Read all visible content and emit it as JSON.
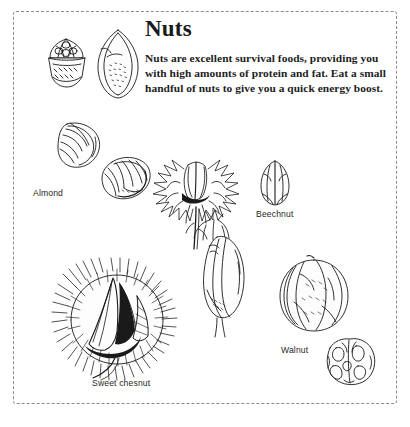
{
  "page": {
    "background_color": "#ffffff",
    "border_style": "dashed",
    "border_color": "#8b8b8b"
  },
  "header": {
    "title": "Nuts",
    "body": "Nuts are excellent survival foods, providing you with high amounts of protein and fat. Eat a small handful of nuts to give you a quick energy boost."
  },
  "labels": {
    "almond": "Almond",
    "beechnut": "Beechnut",
    "walnut": "Walnut",
    "sweet_chestnut": "Sweet chesnut"
  },
  "illustrations": [
    {
      "name": "acorn-in-cup-drawing",
      "label": ""
    },
    {
      "name": "almond-whole-drawing",
      "label": ""
    },
    {
      "name": "almond-shell-drawing",
      "label": "Almond"
    },
    {
      "name": "almond-split-drawing",
      "label": "Almond"
    },
    {
      "name": "beechnut-husk-drawing",
      "label": ""
    },
    {
      "name": "beechnut-drawing",
      "label": "Beechnut"
    },
    {
      "name": "chestnut-kernel-drawing",
      "label": ""
    },
    {
      "name": "sweet-chestnut-burr-drawing",
      "label": "Sweet chesnut"
    },
    {
      "name": "walnut-shell-drawing",
      "label": "Walnut"
    },
    {
      "name": "walnut-kernel-drawing",
      "label": "Walnut"
    }
  ],
  "ink_color": "#1a1a1a"
}
